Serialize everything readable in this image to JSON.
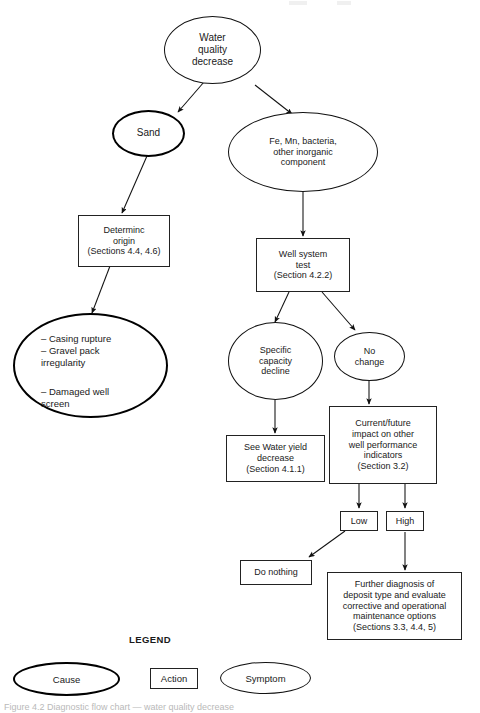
{
  "figure": {
    "caption": "Figure 4.2 Diagnostic flow chart — water quality decrease"
  },
  "nodes": {
    "water_quality": "Water\nquality\ndecrease",
    "sand": "Sand",
    "inorganic": "Fe, Mn, bacteria,\nother inorganic\ncomponent",
    "determine_origin": "Determinc\norigin\n(Sections 4.4, 4.6)",
    "causes": {
      "line1": "– Casing rupture",
      "line2": "– Gravel pack\n   irregularity",
      "line3": "– Damaged well\n   screen"
    },
    "well_system_test": "Well system\ntest\n(Section 4.2.2)",
    "specific_capacity": "Specific\ncapacity\ndecline",
    "no_change": "No\nchange",
    "see_water_yield": "See Water yield\ndecrease\n(Section 4.1.1)",
    "current_future": "Current/future\nimpact on other\nwell performance\nindicators\n(Section 3.2)",
    "low": "Low",
    "high": "High",
    "do_nothing": "Do nothing",
    "further_diagnosis": "Further diagnosis of\ndeposit type and evaluate\ncorrective and operational\nmaintenance options\n(Sections 3.3, 4.4, 5)"
  },
  "legend": {
    "title": "LEGEND",
    "cause": "Cause",
    "action": "Action",
    "symptom": "Symptom"
  },
  "colors": {
    "stroke": "#111111",
    "background": "#ffffff",
    "text": "#1a1a1a"
  }
}
